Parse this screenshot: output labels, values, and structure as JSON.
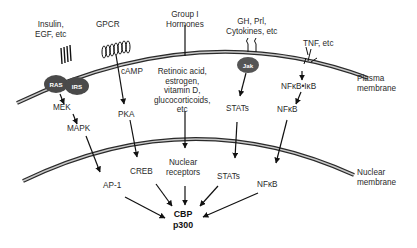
{
  "diagram": {
    "title": "",
    "membranes": {
      "plasma": "Plasma\nmembrane",
      "nuclear": "Nuclear\nmembrane"
    },
    "stimuli": {
      "insulin": "Insulin,\nEGF, etc",
      "gpcr": "GPCR",
      "group1": "Group I\nHormones",
      "gh": "GH, Prl,\nCytokines, etc",
      "tnf": "TNF, etc"
    },
    "cytoplasm": {
      "ras": "RAS",
      "irs": "IRS",
      "mek": "MEK",
      "mapk": "MAPK",
      "camp": "cAMP",
      "pka": "PKA",
      "ligands": "Retinoic acid,\nestrogen,\nvitamin D,\nglucocorticoids,\netc",
      "jak": "Jak",
      "stats": "STATs",
      "nfkb_ikb": "NFκB•IκB",
      "nfkb": "NFκB"
    },
    "nucleus": {
      "ap1": "AP-1",
      "creb": "CREB",
      "nuclear_receptors": "Nuclear\nreceptors",
      "stats": "STATs",
      "nfkb": "NFκB",
      "target": "CBP\np300"
    },
    "colors": {
      "line": "#1a1a1a",
      "membrane_fill": "#bdbdbd",
      "bubble": "#555555",
      "text": "#2a2a2a"
    }
  }
}
